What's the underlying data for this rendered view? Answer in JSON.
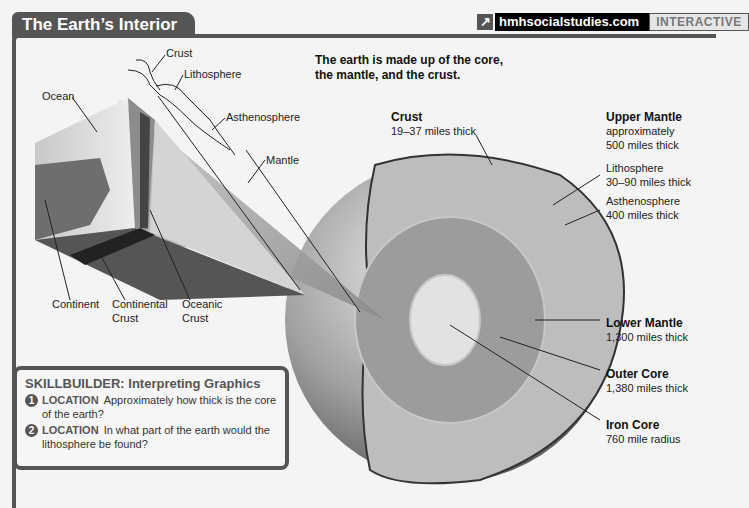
{
  "header": {
    "title": "The Earth’s Interior",
    "site_link": "hmhsocialstudies.com",
    "interactive_label": "INTERACTIVE",
    "link_icon": "external-arrow-icon"
  },
  "intro": {
    "line1": "The earth is made up of the core,",
    "line2": "the mantle, and the crust."
  },
  "block_labels": {
    "crust": "Crust",
    "lithosphere": "Lithosphere",
    "asthenosphere": "Asthenosphere",
    "mantle": "Mantle",
    "ocean": "Ocean",
    "continent": "Continent",
    "continental_crust_1": "Continental",
    "continental_crust_2": "Crust",
    "oceanic_crust_1": "Oceanic",
    "oceanic_crust_2": "Crust"
  },
  "globe_labels": {
    "crust": {
      "title": "Crust",
      "desc": "19–37 miles thick"
    },
    "upper_mantle": {
      "title": "Upper Mantle",
      "desc1": "approximately",
      "desc2": "500 miles thick"
    },
    "lithosphere": {
      "title": "Lithosphere",
      "desc": "30–90 miles thick"
    },
    "asthenosphere": {
      "title": "Asthenosphere",
      "desc": "400 miles thick"
    },
    "lower_mantle": {
      "title": "Lower Mantle",
      "desc": "1,300 miles thick"
    },
    "outer_core": {
      "title": "Outer Core",
      "desc": "1,380 miles thick"
    },
    "iron_core": {
      "title": "Iron Core",
      "desc": "760 mile radius"
    }
  },
  "skillbuilder": {
    "title": "SKILLBUILDER: Interpreting Graphics",
    "questions": [
      {
        "num": "1",
        "tag": "LOCATION",
        "line1": "Approximately how thick is the core",
        "line2": "of the earth?"
      },
      {
        "num": "2",
        "tag": "LOCATION",
        "line1": "In what part of the earth would the",
        "line2": "lithosphere be found?"
      }
    ]
  },
  "colors": {
    "frame": "#555555",
    "mantle": "#b8b8b8",
    "outer_core": "#9a9a9a",
    "inner_core": "#dcdcdc"
  }
}
